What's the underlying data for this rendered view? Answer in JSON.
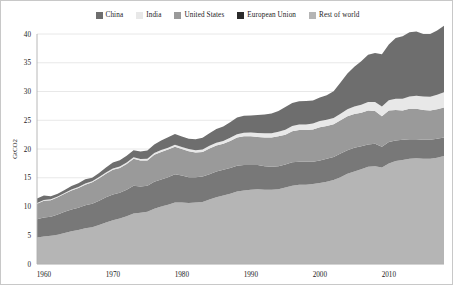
{
  "chart_data": {
    "type": "area",
    "stacked": true,
    "title": "",
    "xlabel": "",
    "ylabel": "GtCO2",
    "xlim": [
      1959,
      2018
    ],
    "ylim": [
      0,
      40
    ],
    "yticks": [
      0,
      5,
      10,
      15,
      20,
      25,
      30,
      35,
      40
    ],
    "xticks": [
      1960,
      1970,
      1980,
      1990,
      2000,
      2010
    ],
    "grid": true,
    "legend_position": "top-center",
    "x": [
      1959,
      1960,
      1961,
      1962,
      1963,
      1964,
      1965,
      1966,
      1967,
      1968,
      1969,
      1970,
      1971,
      1972,
      1973,
      1974,
      1975,
      1976,
      1977,
      1978,
      1979,
      1980,
      1981,
      1982,
      1983,
      1984,
      1985,
      1986,
      1987,
      1988,
      1989,
      1990,
      1991,
      1992,
      1993,
      1994,
      1995,
      1996,
      1997,
      1998,
      1999,
      2000,
      2001,
      2002,
      2003,
      2004,
      2005,
      2006,
      2007,
      2008,
      2009,
      2010,
      2011,
      2012,
      2013,
      2014,
      2015,
      2016,
      2017,
      2018
    ],
    "series": [
      {
        "name": "Rest of world",
        "color": "#b5b5b5",
        "stack_order": 0,
        "values": [
          4.6,
          4.8,
          4.9,
          5.1,
          5.4,
          5.7,
          5.9,
          6.2,
          6.4,
          6.8,
          7.2,
          7.6,
          7.9,
          8.3,
          8.8,
          8.9,
          9.1,
          9.6,
          10.0,
          10.3,
          10.7,
          10.7,
          10.6,
          10.7,
          10.8,
          11.2,
          11.6,
          11.9,
          12.2,
          12.6,
          12.8,
          12.9,
          13.0,
          12.9,
          12.9,
          13.0,
          13.3,
          13.6,
          13.8,
          13.8,
          13.9,
          14.1,
          14.3,
          14.6,
          15.1,
          15.7,
          16.1,
          16.5,
          16.9,
          17.0,
          16.8,
          17.5,
          17.9,
          18.1,
          18.3,
          18.4,
          18.3,
          18.3,
          18.5,
          18.8
        ]
      },
      {
        "name": "European Union",
        "color": "#787878",
        "stack_order": 1,
        "values": [
          3.2,
          3.3,
          3.3,
          3.5,
          3.7,
          3.8,
          3.9,
          4.0,
          4.1,
          4.2,
          4.4,
          4.5,
          4.5,
          4.6,
          4.8,
          4.6,
          4.5,
          4.7,
          4.7,
          4.8,
          4.9,
          4.7,
          4.5,
          4.4,
          4.4,
          4.4,
          4.5,
          4.5,
          4.5,
          4.5,
          4.4,
          4.3,
          4.2,
          4.1,
          4.0,
          4.0,
          4.0,
          4.1,
          4.0,
          4.0,
          3.9,
          3.9,
          4.0,
          4.0,
          4.1,
          4.1,
          4.1,
          4.0,
          3.9,
          3.9,
          3.6,
          3.7,
          3.6,
          3.5,
          3.4,
          3.3,
          3.3,
          3.3,
          3.3,
          3.2
        ]
      },
      {
        "name": "United States",
        "color": "#9a9a9a",
        "stack_order": 2,
        "values": [
          2.7,
          2.9,
          2.9,
          3.0,
          3.1,
          3.3,
          3.4,
          3.6,
          3.7,
          3.9,
          4.1,
          4.3,
          4.3,
          4.5,
          4.7,
          4.5,
          4.4,
          4.7,
          4.8,
          4.8,
          4.8,
          4.6,
          4.5,
          4.3,
          4.3,
          4.5,
          4.5,
          4.5,
          4.7,
          4.9,
          5.0,
          5.0,
          4.9,
          5.0,
          5.1,
          5.2,
          5.2,
          5.4,
          5.5,
          5.5,
          5.6,
          5.8,
          5.7,
          5.7,
          5.8,
          5.9,
          5.9,
          5.8,
          5.9,
          5.7,
          5.3,
          5.5,
          5.3,
          5.1,
          5.3,
          5.3,
          5.2,
          5.1,
          5.1,
          5.2
        ]
      },
      {
        "name": "India",
        "color": "#e8e8e8",
        "stack_order": 3,
        "values": [
          0.12,
          0.13,
          0.14,
          0.15,
          0.16,
          0.17,
          0.18,
          0.19,
          0.2,
          0.21,
          0.22,
          0.23,
          0.24,
          0.25,
          0.26,
          0.27,
          0.29,
          0.31,
          0.32,
          0.33,
          0.34,
          0.35,
          0.38,
          0.4,
          0.42,
          0.45,
          0.48,
          0.51,
          0.55,
          0.58,
          0.62,
          0.66,
          0.7,
          0.73,
          0.76,
          0.8,
          0.86,
          0.9,
          0.95,
          0.98,
          1.03,
          1.06,
          1.08,
          1.11,
          1.15,
          1.23,
          1.29,
          1.38,
          1.48,
          1.58,
          1.7,
          1.78,
          1.92,
          2.02,
          2.12,
          2.24,
          2.32,
          2.4,
          2.52,
          2.65
        ]
      },
      {
        "name": "China",
        "color": "#6e6e6e",
        "stack_order": 4,
        "values": [
          0.78,
          0.8,
          0.56,
          0.48,
          0.52,
          0.58,
          0.66,
          0.73,
          0.62,
          0.7,
          0.86,
          1.02,
          1.1,
          1.16,
          1.24,
          1.28,
          1.45,
          1.48,
          1.65,
          1.8,
          1.85,
          1.82,
          1.8,
          1.9,
          2.02,
          2.2,
          2.4,
          2.52,
          2.72,
          2.9,
          2.95,
          2.95,
          3.1,
          3.25,
          3.42,
          3.62,
          3.95,
          4.0,
          4.05,
          4.05,
          4.0,
          4.1,
          4.25,
          4.65,
          5.4,
          6.2,
          6.9,
          7.6,
          8.2,
          8.5,
          9.1,
          9.7,
          10.6,
          10.9,
          11.2,
          11.2,
          10.9,
          10.9,
          11.2,
          11.6
        ]
      }
    ]
  },
  "legend": {
    "items": [
      {
        "label": "China",
        "color": "#6e6e6e"
      },
      {
        "label": "India",
        "color": "#e8e8e8"
      },
      {
        "label": "United States",
        "color": "#9a9a9a"
      },
      {
        "label": "European Union",
        "color": "#2b2b2b"
      },
      {
        "label": "Rest of world",
        "color": "#b5b5b5"
      }
    ]
  },
  "axes": {
    "y_title": "GtCO2",
    "y_tick_labels": [
      "0",
      "5",
      "10",
      "15",
      "20",
      "25",
      "30",
      "35",
      "40"
    ],
    "x_tick_labels": [
      "1960",
      "1970",
      "1980",
      "1990",
      "2000",
      "2010"
    ]
  }
}
